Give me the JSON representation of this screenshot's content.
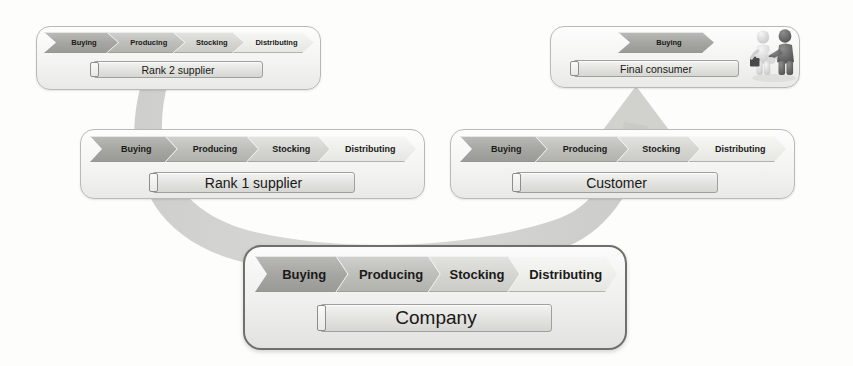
{
  "diagram": {
    "background_color": "#fdfdfc",
    "process_steps": [
      "Buying",
      "Producing",
      "Stocking",
      "Distributing"
    ],
    "entities": [
      {
        "id": "rank-2-supplier",
        "label": "Rank 2 supplier",
        "steps": [
          "Buying",
          "Producing",
          "Stocking",
          "Distributing"
        ],
        "position": "top-left"
      },
      {
        "id": "final-consumer",
        "label": "Final consumer",
        "steps": [
          "Buying"
        ],
        "position": "top-right",
        "has_handshake_figures": true
      },
      {
        "id": "rank-1-supplier",
        "label": "Rank 1 supplier",
        "steps": [
          "Buying",
          "Producing",
          "Stocking",
          "Distributing"
        ],
        "position": "middle-left"
      },
      {
        "id": "customer",
        "label": "Customer",
        "steps": [
          "Buying",
          "Producing",
          "Stocking",
          "Distributing"
        ],
        "position": "middle-right"
      },
      {
        "id": "company",
        "label": "Company",
        "steps": [
          "Buying",
          "Producing",
          "Stocking",
          "Distributing"
        ],
        "position": "bottom-center",
        "emphasized": true
      }
    ],
    "flow_arrow": {
      "name": "upstream-to-downstream-arc",
      "direction": "from supplier side, under company, up to consumer side",
      "color": "#c9c9c6"
    },
    "icons": {
      "handshake": "handshake-figures-icon"
    },
    "colors": {
      "chevron_darkest": "#a6a6a2",
      "chevron_dark": "#bebeba",
      "chevron_light": "#d5d5d1",
      "chevron_lightest": "#eeeeea",
      "box_border": "#b9b9b5",
      "emphasis_border": "#6f6f6c",
      "arc": "#c9c9c6",
      "figure_light": "#dedede",
      "figure_dark": "#6a6a6a"
    }
  }
}
